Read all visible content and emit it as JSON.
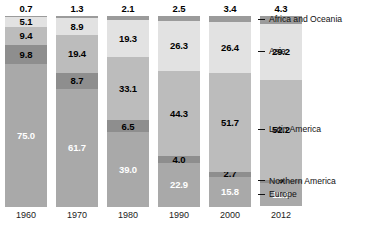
{
  "chart_data": {
    "type": "bar",
    "subtype": "stacked-percentage",
    "title": "",
    "xlabel": "",
    "ylabel": "",
    "ylim": [
      0,
      100
    ],
    "grid": false,
    "legend_position": "right",
    "categories": [
      "1960",
      "1970",
      "1980",
      "1990",
      "2000",
      "2012"
    ],
    "series": [
      {
        "name": "Africa and Oceania",
        "color": "#9b9b9b",
        "values": [
          0.7,
          1.3,
          2.1,
          2.5,
          3.4,
          4.3
        ],
        "labels": [
          "0.7",
          "1.3",
          "2.1",
          "2.5",
          "3.4",
          "4.3"
        ],
        "label_position": "above-bar"
      },
      {
        "name": "Asia",
        "color": "#e2e2e2",
        "values": [
          5.1,
          8.9,
          19.3,
          26.3,
          26.4,
          29.2
        ],
        "labels": [
          "5.1",
          "8.9",
          "19.3",
          "26.3",
          "26.4",
          "29.2"
        ],
        "label_position": "inside"
      },
      {
        "name": "Latin America",
        "color": "#bcbcbc",
        "values": [
          9.4,
          19.4,
          33.1,
          44.3,
          51.7,
          52.2
        ],
        "labels": [
          "9.4",
          "19.4",
          "33.1",
          "44.3",
          "51.7",
          "52.2"
        ],
        "label_position": "inside"
      },
      {
        "name": "Northern America",
        "color": "#8e8e8e",
        "values": [
          9.8,
          8.7,
          6.5,
          4.0,
          2.7,
          2.0
        ],
        "labels": [
          "9.8",
          "8.7",
          "6.5",
          "4.0",
          "2.7",
          "2"
        ],
        "label_position": "inside"
      },
      {
        "name": "Europe",
        "color": "#a9a9a9",
        "values": [
          75.0,
          61.7,
          39.0,
          22.9,
          15.8,
          11.8
        ],
        "labels": [
          "75.0",
          "61.7",
          "39.0",
          "22.9",
          "15.8",
          "11.8"
        ],
        "label_position": "inside"
      }
    ]
  },
  "legend": {
    "items": [
      {
        "label": "Africa and Oceania"
      },
      {
        "label": "Asia"
      },
      {
        "label": "Latin America"
      },
      {
        "label": "Northern America"
      },
      {
        "label": "Europe"
      }
    ]
  },
  "axis": {
    "years": [
      "1960",
      "1970",
      "1980",
      "1990",
      "2000",
      "2012"
    ]
  }
}
